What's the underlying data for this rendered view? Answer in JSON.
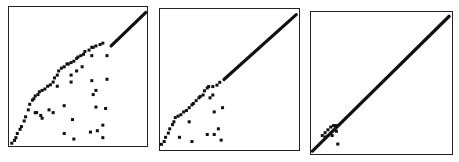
{
  "chart_data": [
    {
      "type": "scatter",
      "title": "",
      "xlabel": "",
      "ylabel": "",
      "xlim": [
        0,
        1
      ],
      "ylim": [
        0,
        1
      ],
      "grid": false,
      "ticks": "none",
      "series": [
        {
          "name": "diagonal-segment",
          "kind": "line",
          "points": [
            [
              0.74,
              0.72
            ],
            [
              0.99,
              0.96
            ]
          ]
        },
        {
          "name": "upper-envelope",
          "points": [
            [
              0.02,
              0.02
            ],
            [
              0.04,
              0.04
            ],
            [
              0.05,
              0.06
            ],
            [
              0.06,
              0.09
            ],
            [
              0.08,
              0.12
            ],
            [
              0.09,
              0.14
            ],
            [
              0.11,
              0.18
            ],
            [
              0.12,
              0.21
            ],
            [
              0.14,
              0.26
            ],
            [
              0.15,
              0.3
            ],
            [
              0.17,
              0.33
            ],
            [
              0.18,
              0.34
            ],
            [
              0.19,
              0.36
            ],
            [
              0.21,
              0.37
            ],
            [
              0.22,
              0.39
            ],
            [
              0.24,
              0.4
            ],
            [
              0.26,
              0.41
            ],
            [
              0.28,
              0.43
            ],
            [
              0.3,
              0.44
            ],
            [
              0.32,
              0.46
            ],
            [
              0.33,
              0.49
            ],
            [
              0.35,
              0.51
            ],
            [
              0.36,
              0.54
            ],
            [
              0.38,
              0.56
            ],
            [
              0.4,
              0.57
            ],
            [
              0.42,
              0.59
            ],
            [
              0.43,
              0.59
            ],
            [
              0.45,
              0.6
            ],
            [
              0.47,
              0.61
            ],
            [
              0.49,
              0.63
            ],
            [
              0.5,
              0.64
            ],
            [
              0.52,
              0.65
            ],
            [
              0.54,
              0.66
            ],
            [
              0.55,
              0.68
            ],
            [
              0.58,
              0.69
            ],
            [
              0.6,
              0.71
            ],
            [
              0.61,
              0.71
            ],
            [
              0.63,
              0.72
            ],
            [
              0.66,
              0.73
            ],
            [
              0.68,
              0.74
            ]
          ]
        },
        {
          "name": "scattered",
          "points": [
            [
              0.19,
              0.24
            ],
            [
              0.2,
              0.24
            ],
            [
              0.23,
              0.22
            ],
            [
              0.24,
              0.2
            ],
            [
              0.29,
              0.26
            ],
            [
              0.32,
              0.24
            ],
            [
              0.35,
              0.43
            ],
            [
              0.4,
              0.29
            ],
            [
              0.45,
              0.51
            ],
            [
              0.45,
              0.46
            ],
            [
              0.46,
              0.19
            ],
            [
              0.4,
              0.09
            ],
            [
              0.47,
              0.05
            ],
            [
              0.49,
              0.54
            ],
            [
              0.53,
              0.57
            ],
            [
              0.59,
              0.1
            ],
            [
              0.6,
              0.65
            ],
            [
              0.6,
              0.47
            ],
            [
              0.61,
              0.37
            ],
            [
              0.63,
              0.4
            ],
            [
              0.63,
              0.28
            ],
            [
              0.64,
              0.11
            ],
            [
              0.68,
              0.15
            ],
            [
              0.68,
              0.06
            ],
            [
              0.71,
              0.65
            ],
            [
              0.71,
              0.48
            ],
            [
              0.7,
              0.27
            ]
          ]
        }
      ]
    },
    {
      "type": "scatter",
      "title": "",
      "xlabel": "",
      "ylabel": "",
      "xlim": [
        0,
        1
      ],
      "ylim": [
        0,
        1
      ],
      "grid": false,
      "ticks": "none",
      "series": [
        {
          "name": "diagonal-segment",
          "kind": "line",
          "points": [
            [
              0.46,
              0.5
            ],
            [
              0.98,
              0.96
            ]
          ]
        },
        {
          "name": "upper-envelope",
          "points": [
            [
              0.01,
              0.04
            ],
            [
              0.03,
              0.06
            ],
            [
              0.04,
              0.09
            ],
            [
              0.06,
              0.12
            ],
            [
              0.07,
              0.15
            ],
            [
              0.09,
              0.18
            ],
            [
              0.1,
              0.2
            ],
            [
              0.11,
              0.23
            ],
            [
              0.13,
              0.24
            ],
            [
              0.15,
              0.25
            ],
            [
              0.17,
              0.27
            ],
            [
              0.19,
              0.28
            ],
            [
              0.21,
              0.3
            ],
            [
              0.23,
              0.32
            ],
            [
              0.24,
              0.33
            ],
            [
              0.26,
              0.35
            ],
            [
              0.28,
              0.37
            ],
            [
              0.29,
              0.38
            ],
            [
              0.31,
              0.39
            ],
            [
              0.32,
              0.42
            ],
            [
              0.34,
              0.44
            ],
            [
              0.35,
              0.45
            ],
            [
              0.38,
              0.45
            ],
            [
              0.41,
              0.46
            ],
            [
              0.43,
              0.48
            ]
          ]
        },
        {
          "name": "scattered",
          "points": [
            [
              0.36,
              0.37
            ],
            [
              0.38,
              0.39
            ],
            [
              0.39,
              0.27
            ],
            [
              0.45,
              0.3
            ],
            [
              0.21,
              0.2
            ],
            [
              0.14,
              0.09
            ],
            [
              0.23,
              0.06
            ],
            [
              0.34,
              0.11
            ],
            [
              0.39,
              0.11
            ],
            [
              0.42,
              0.15
            ],
            [
              0.44,
              0.07
            ]
          ]
        }
      ]
    },
    {
      "type": "scatter",
      "title": "",
      "xlabel": "",
      "ylabel": "",
      "xlim": [
        0,
        1
      ],
      "ylim": [
        0,
        1
      ],
      "grid": false,
      "ticks": "none",
      "series": [
        {
          "name": "diagonal-segment",
          "kind": "line",
          "points": [
            [
              0.01,
              0.02
            ],
            [
              0.98,
              0.97
            ]
          ]
        },
        {
          "name": "upper-envelope",
          "points": [
            [
              0.08,
              0.13
            ],
            [
              0.1,
              0.15
            ],
            [
              0.12,
              0.17
            ],
            [
              0.14,
              0.19
            ],
            [
              0.16,
              0.2
            ],
            [
              0.18,
              0.2
            ]
          ]
        },
        {
          "name": "scattered",
          "points": [
            [
              0.1,
              0.12
            ],
            [
              0.15,
              0.13
            ],
            [
              0.18,
              0.16
            ],
            [
              0.19,
              0.07
            ]
          ]
        }
      ]
    }
  ],
  "style": {
    "marker_color": "#111111",
    "frame_color": "#222222",
    "background": "#ffffff"
  },
  "caption": ""
}
